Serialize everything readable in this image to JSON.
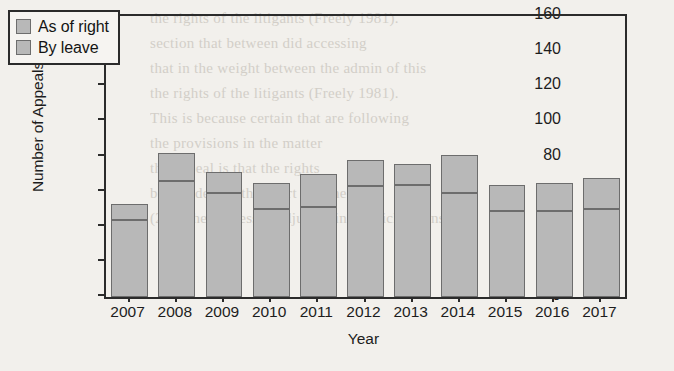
{
  "chart_data": {
    "type": "bar",
    "stacked": true,
    "title": "",
    "xlabel": "Year",
    "ylabel": "Number of Appeals",
    "categories": [
      "2007",
      "2008",
      "2009",
      "2010",
      "2011",
      "2012",
      "2013",
      "2014",
      "2015",
      "2016",
      "2017"
    ],
    "series": [
      {
        "name": "By leave",
        "values": [
          44,
          66,
          59,
          50,
          51,
          63,
          64,
          59,
          49,
          49,
          50
        ]
      },
      {
        "name": "As of right",
        "values": [
          9,
          16,
          12,
          15,
          19,
          15,
          12,
          22,
          15,
          16,
          18
        ]
      }
    ],
    "totals": [
      53,
      82,
      71,
      65,
      70,
      78,
      76,
      81,
      64,
      65,
      68
    ],
    "ylim": [
      0,
      160
    ],
    "yticks": [
      0,
      20,
      40,
      60,
      80,
      100,
      120,
      140,
      160
    ],
    "grid": false,
    "legend_position": "top-left",
    "legend_entries": [
      "As of right",
      "By leave"
    ],
    "colors": {
      "bar_fill": "#b8b8b8",
      "bar_edge": "#6d6d6d",
      "axis": "#2b2b2b",
      "text": "#1d1d1d",
      "background": "#f2f0ec"
    }
  },
  "background_text": "the rights of the litigants (Freely 1981).\nsection that between did accessing\nthat in the weight between the admin of this\nthe rights of the litigants (Freely 1981).\nThis is because certain that are following\nthe provisions in the matter\nthe appeal is that the rights\nbe decided by the court and the\n(279) the process is adjudicating, which means that"
}
